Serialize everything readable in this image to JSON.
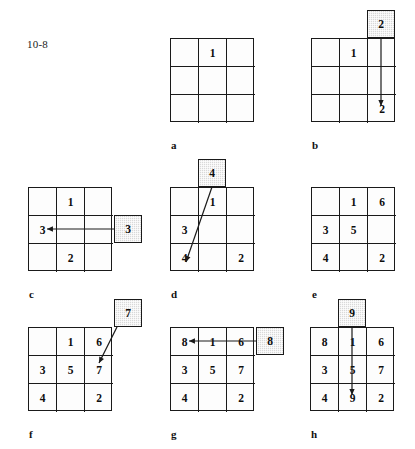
{
  "figure": {
    "number_label": "10-8",
    "cell_size": 28,
    "shade_color": "#d9d9d9",
    "line_color": "#1a1a1a"
  },
  "panels": [
    {
      "letter": "a",
      "grid_x": 170,
      "grid_y": 38,
      "letter_x": 171,
      "letter_y": 139,
      "cells": [
        "",
        "1",
        "",
        "",
        "",
        "",
        "",
        "",
        ""
      ],
      "shaded": null,
      "arrow": null
    },
    {
      "letter": "b",
      "grid_x": 311,
      "grid_y": 38,
      "letter_x": 312,
      "letter_y": 139,
      "cells": [
        "",
        "1",
        "",
        "",
        "",
        "",
        "",
        "",
        "2"
      ],
      "shaded": {
        "value": "2",
        "x": 367,
        "y": 10
      },
      "arrow": {
        "x1": 381,
        "y1": 38,
        "x2": 381,
        "y2": 106
      }
    },
    {
      "letter": "c",
      "grid_x": 28,
      "grid_y": 187,
      "letter_x": 29,
      "letter_y": 288,
      "cells": [
        "",
        "1",
        "",
        "3",
        "",
        "",
        "",
        "2",
        ""
      ],
      "shaded": {
        "value": "3",
        "x": 114,
        "y": 215
      },
      "arrow": {
        "x1": 114,
        "y1": 229,
        "x2": 47,
        "y2": 229
      }
    },
    {
      "letter": "d",
      "grid_x": 170,
      "grid_y": 187,
      "letter_x": 171,
      "letter_y": 288,
      "cells": [
        "",
        "1",
        "",
        "3",
        "",
        "",
        "4",
        "",
        "2"
      ],
      "shaded": {
        "value": "4",
        "x": 198,
        "y": 159
      },
      "arrow": {
        "x1": 212,
        "y1": 187,
        "x2": 186,
        "y2": 262
      }
    },
    {
      "letter": "e",
      "grid_x": 311,
      "grid_y": 187,
      "letter_x": 312,
      "letter_y": 288,
      "cells": [
        "",
        "1",
        "6",
        "3",
        "5",
        "",
        "4",
        "",
        "2"
      ],
      "shaded": null,
      "arrow": null
    },
    {
      "letter": "f",
      "grid_x": 28,
      "grid_y": 327,
      "letter_x": 29,
      "letter_y": 428,
      "cells": [
        "",
        "1",
        "6",
        "3",
        "5",
        "7",
        "4",
        "",
        "2"
      ],
      "shaded": {
        "value": "7",
        "x": 114,
        "y": 299
      },
      "arrow": {
        "x1": 117,
        "y1": 327,
        "x2": 99,
        "y2": 363
      }
    },
    {
      "letter": "g",
      "grid_x": 170,
      "grid_y": 327,
      "letter_x": 171,
      "letter_y": 428,
      "cells": [
        "8",
        "1",
        "6",
        "3",
        "5",
        "7",
        "4",
        "",
        "2"
      ],
      "shaded": {
        "value": "8",
        "x": 256,
        "y": 327
      },
      "arrow": {
        "x1": 256,
        "y1": 341,
        "x2": 189,
        "y2": 341
      }
    },
    {
      "letter": "h",
      "grid_x": 310,
      "grid_y": 327,
      "letter_x": 311,
      "letter_y": 428,
      "cells": [
        "8",
        "1",
        "6",
        "3",
        "5",
        "7",
        "4",
        "9",
        "2"
      ],
      "shaded": {
        "value": "9",
        "x": 338,
        "y": 299
      },
      "arrow": {
        "x1": 352,
        "y1": 327,
        "x2": 352,
        "y2": 395
      }
    }
  ]
}
